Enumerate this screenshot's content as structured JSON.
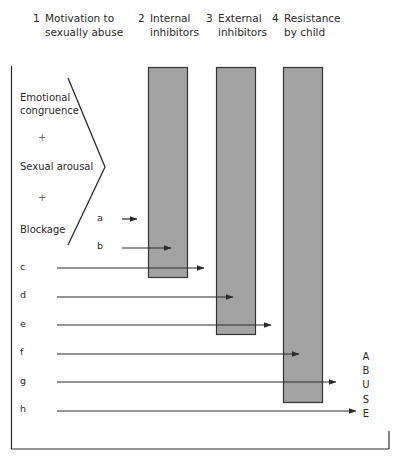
{
  "headers": [
    {
      "num": "1",
      "line1": "Motivation to",
      "line2": "sexually abuse"
    },
    {
      "num": "2",
      "line1": "Internal",
      "line2": "inhibitors"
    },
    {
      "num": "3",
      "line1": "External",
      "line2": "inhibitors"
    },
    {
      "num": "4",
      "line1": "Resistance",
      "line2": "by child"
    }
  ],
  "motivation_factors": {
    "emotional_line1": "Emotional",
    "emotional_line2": "congruence",
    "plus1": "+",
    "sexual_arousal": "Sexual arousal",
    "plus2": "+",
    "blockage": "Blockage"
  },
  "paths": [
    {
      "label": "a",
      "stops_at": "before internal inhibitors"
    },
    {
      "label": "b",
      "stops_at": "internal inhibitors"
    },
    {
      "label": "c",
      "stops_at": "before external inhibitors"
    },
    {
      "label": "d",
      "stops_at": "external inhibitors"
    },
    {
      "label": "e",
      "stops_at": "before resistance by child"
    },
    {
      "label": "f",
      "stops_at": "resistance by child"
    },
    {
      "label": "g",
      "stops_at": "past resistance by child"
    },
    {
      "label": "h",
      "stops_at": "abuse"
    }
  ],
  "outcome": {
    "letters": [
      "A",
      "B",
      "U",
      "S",
      "E"
    ]
  },
  "colors": {
    "bar_fill": "#a3a3a3",
    "bar_stroke": "#333333",
    "line": "#2a2a2a"
  }
}
